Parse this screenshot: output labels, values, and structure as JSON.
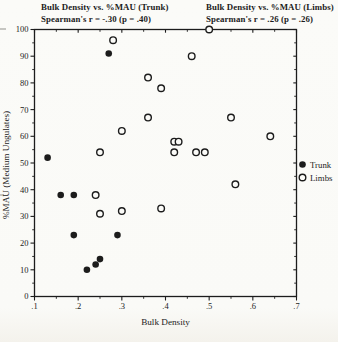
{
  "titles": {
    "trunk_line1": "Bulk Density vs. %MAU (Trunk)",
    "trunk_line2": "Spearman's r = -.30 (p = .40)",
    "limbs_line1": "Bulk Density vs. %MAU (Limbs)",
    "limbs_line2": "Spearman's r = .26 (p = .26)"
  },
  "chart_data": {
    "type": "scatter",
    "xlabel": "Bulk Density",
    "ylabel": "%MAU (Medium Ungulates)",
    "xlim": [
      0.1,
      0.7
    ],
    "ylim": [
      0,
      100
    ],
    "x_tick_values": [
      0.1,
      0.2,
      0.3,
      0.4,
      0.5,
      0.6,
      0.7
    ],
    "x_tick_labels": [
      ".1",
      ".2",
      ".3",
      ".4",
      ".5",
      ".6",
      ".7"
    ],
    "x_minor_step": 0.05,
    "y_tick_values": [
      0,
      10,
      20,
      30,
      40,
      50,
      60,
      70,
      80,
      90,
      100
    ],
    "y_tick_labels": [
      "0",
      "10",
      "20",
      "30",
      "40",
      "50",
      "60",
      "70",
      "80",
      "90",
      "100"
    ],
    "y_minor_step": 5,
    "grid": false,
    "ink_color": "#1c1c1c",
    "paper_color": "#fbfbf8",
    "series": [
      {
        "name": "Limbs",
        "marker": "open",
        "points": [
          [
            0.24,
            38
          ],
          [
            0.25,
            31
          ],
          [
            0.25,
            54
          ],
          [
            0.28,
            96
          ],
          [
            0.3,
            32
          ],
          [
            0.3,
            62
          ],
          [
            0.36,
            67
          ],
          [
            0.36,
            82
          ],
          [
            0.39,
            33
          ],
          [
            0.39,
            78
          ],
          [
            0.42,
            54
          ],
          [
            0.42,
            58
          ],
          [
            0.43,
            58
          ],
          [
            0.46,
            90
          ],
          [
            0.47,
            54
          ],
          [
            0.49,
            54
          ],
          [
            0.5,
            100
          ],
          [
            0.55,
            67
          ],
          [
            0.56,
            42
          ],
          [
            0.64,
            60
          ]
        ]
      },
      {
        "name": "Trunk",
        "marker": "filled",
        "points": [
          [
            0.13,
            52
          ],
          [
            0.16,
            38
          ],
          [
            0.19,
            38
          ],
          [
            0.19,
            23
          ],
          [
            0.22,
            10
          ],
          [
            0.24,
            12
          ],
          [
            0.25,
            14
          ],
          [
            0.27,
            91
          ],
          [
            0.29,
            23
          ]
        ]
      }
    ],
    "legend": {
      "position": "right-middle",
      "items": [
        {
          "label": "Trunk",
          "marker": "filled"
        },
        {
          "label": "Limbs",
          "marker": "open"
        }
      ]
    }
  }
}
